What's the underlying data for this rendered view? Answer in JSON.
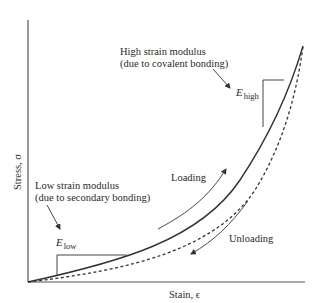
{
  "figure": {
    "axes": {
      "x_label": "Stain, ϵ",
      "y_label": "Stress, σ"
    },
    "annotations": {
      "high": {
        "line1": "High strain modulus",
        "line2": "(due to covalent bonding)",
        "symbol": "E",
        "subscript": "high"
      },
      "low": {
        "line1": "Low strain modulus",
        "line2": "(due to secondary bonding)",
        "symbol": "E",
        "subscript": "low"
      },
      "loading": "Loading",
      "unloading": "Unloading"
    },
    "curves": [
      {
        "name": "loading",
        "style": "solid"
      },
      {
        "name": "unloading",
        "style": "dashed"
      }
    ],
    "colors": {
      "line": "#333333",
      "background": "#ffffff"
    }
  }
}
